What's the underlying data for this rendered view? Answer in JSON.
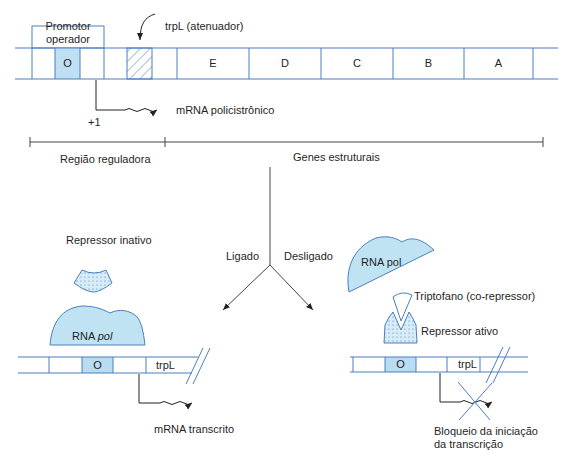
{
  "colors": {
    "line_blue": "#4a7fc1",
    "fill_light_blue": "#bfe3f3",
    "fill_operator": "#b9dcf2",
    "black_line": "#333333"
  },
  "top": {
    "promoter_box_label_line1": "Promotor",
    "promoter_box_label_line2": "operador",
    "attenuator_label": "trpL (atenuador)",
    "operator_label": "O",
    "genes": [
      "E",
      "D",
      "C",
      "B",
      "A"
    ],
    "plus_one": "+1",
    "mrna_label": "mRNA policistrônico"
  },
  "regions": {
    "regulatory": "Região reguladora",
    "structural": "Genes estruturais"
  },
  "branches": {
    "on": "Ligado",
    "off": "Desligado"
  },
  "left": {
    "inactive_repressor": "Repressor inativo",
    "rna_pol_prefix": "RNA ",
    "rna_pol_italic": "pol",
    "operator_label": "O",
    "trpl_label": "trpL",
    "mrna_label": "mRNA transcrito"
  },
  "right": {
    "rna_pol": "RNA pol",
    "tryptophan": "Triptofano (co-repressor)",
    "active_repressor": "Repressor ativo",
    "operator_label": "O",
    "trpl_label": "trpL",
    "block_line1": "Bloqueio da iniciação",
    "block_line2": "da transcrição"
  }
}
